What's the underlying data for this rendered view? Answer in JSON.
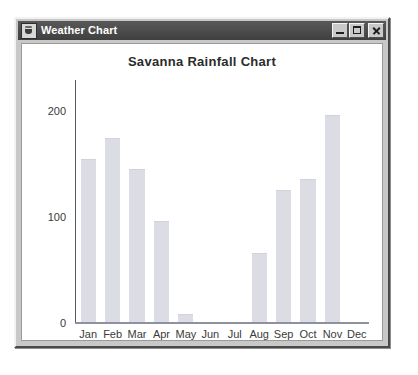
{
  "window": {
    "title": "Weather Chart",
    "icon": "java-cup-icon",
    "controls": {
      "minimize_label": "",
      "maximize_label": "",
      "close_label": ""
    }
  },
  "chart_data": {
    "type": "bar",
    "title": "Savanna Rainfall Chart",
    "xlabel": "",
    "ylabel": "",
    "categories": [
      "Jan",
      "Feb",
      "Mar",
      "Apr",
      "May",
      "Jun",
      "Jul",
      "Aug",
      "Sep",
      "Oct",
      "Nov",
      "Dec"
    ],
    "values": [
      155,
      175,
      145,
      96,
      8,
      0,
      0,
      66,
      125,
      136,
      197,
      0
    ],
    "ylim": [
      0,
      230
    ],
    "yticks": [
      0,
      100,
      200
    ],
    "ytick_labels": [
      "0",
      "100",
      "200"
    ],
    "grid": false,
    "legend": "none",
    "bar_color": "#dcdce4",
    "axis_color": "#555a66",
    "title_color": "#2b2b2b"
  }
}
